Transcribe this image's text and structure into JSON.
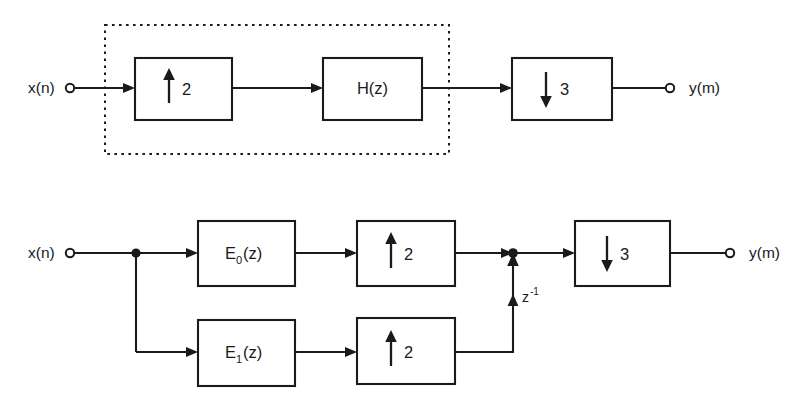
{
  "figure": {
    "background_color": "#ffffff",
    "line_color": "#1a1a1a"
  },
  "diagrams": [
    {
      "id": "direct-form",
      "name": "Direct form rate converter",
      "input_label": "x(n)",
      "output_label": "y(m)",
      "dashed_group_label": "",
      "blocks": [
        {
          "id": "up2",
          "label": "2",
          "icon": "up-arrow",
          "type": "upsampler",
          "factor": "2"
        },
        {
          "id": "hz",
          "label": "H(z)",
          "icon": "",
          "type": "filter",
          "factor": ""
        },
        {
          "id": "down3",
          "label": "3",
          "icon": "down-arrow",
          "type": "downsampler",
          "factor": "3"
        }
      ]
    },
    {
      "id": "polyphase-form",
      "name": "Polyphase form rate converter",
      "input_label": "x(n)",
      "output_label": "y(m)",
      "delay_label": "z",
      "delay_exponent": "-1",
      "blocks": [
        {
          "id": "e0",
          "label": "E",
          "sub": "0",
          "suffix": "(z)",
          "type": "polyphase-filter"
        },
        {
          "id": "up2a",
          "label": "2",
          "icon": "up-arrow",
          "type": "upsampler",
          "factor": "2"
        },
        {
          "id": "e1",
          "label": "E",
          "sub": "1",
          "suffix": "(z)",
          "type": "polyphase-filter"
        },
        {
          "id": "up2b",
          "label": "2",
          "icon": "up-arrow",
          "type": "upsampler",
          "factor": "2"
        },
        {
          "id": "down3b",
          "label": "3",
          "icon": "down-arrow",
          "type": "downsampler",
          "factor": "3"
        }
      ]
    }
  ]
}
